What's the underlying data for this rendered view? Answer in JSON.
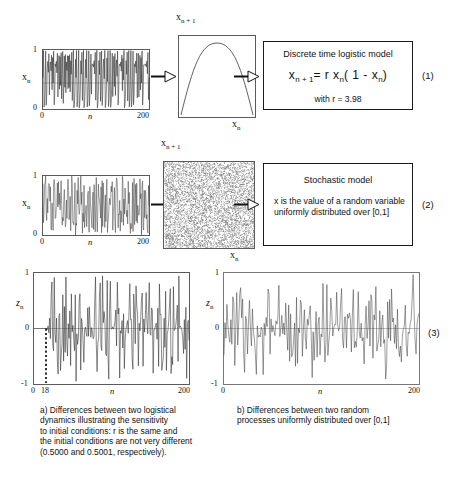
{
  "figure": {
    "rows": [
      {
        "id": "row-1",
        "eq_number": "(1)",
        "timeseries": {
          "ylabel": "x",
          "ylabel_sub": "n",
          "xlabel": "n",
          "yticks": [
            "1",
            "0"
          ],
          "xticks": [
            "0",
            "200"
          ]
        },
        "map_plot": {
          "ylabel": "x",
          "ylabel_sub": "n + 1",
          "xlabel": "x",
          "xlabel_sub": "n",
          "kind": "parabola"
        },
        "model": {
          "title": "Discrete time logistic model",
          "formula_lhs": "x",
          "formula_lhs_sub": "n + 1",
          "formula_rest": "=  r  x",
          "formula_mid_sub": "n",
          "formula_tail": "( 1 -  x",
          "formula_tail_sub": "n",
          "formula_close": ")",
          "note": "with r = 3.98"
        }
      },
      {
        "id": "row-2",
        "eq_number": "(2)",
        "timeseries": {
          "ylabel": "x",
          "ylabel_sub": "n",
          "xlabel": "n",
          "yticks": [
            "1",
            "0"
          ],
          "xticks": [
            "0",
            "200"
          ]
        },
        "map_plot": {
          "ylabel": "x",
          "ylabel_sub": "n + 1",
          "xlabel": "x",
          "xlabel_sub": "n",
          "kind": "uniform-scatter"
        },
        "model": {
          "title": "Stochastic model",
          "body": "x is the value of a random\nvariable uniformly distributed\n over [0,1]"
        }
      },
      {
        "id": "row-3",
        "eq_number": "(3)",
        "left_plot": {
          "ylabel": "z",
          "ylabel_sub": "n",
          "xlabel": "n",
          "yticks": [
            "1",
            "0",
            "-1"
          ],
          "xticks": [
            "0",
            "18",
            "200"
          ],
          "divergence_marker_n": 18
        },
        "right_plot": {
          "ylabel": "z",
          "ylabel_sub": "n",
          "xlabel": "n",
          "yticks": [
            "1",
            "0",
            "-1"
          ],
          "xticks": [
            "0",
            "200"
          ]
        },
        "caption_a": "a)   Differences between two logistical\ndynamics illustrating the sensitivity\nto initial conditions: r is the same and\nthe initial conditions are not very different\n(0.5000 and 0.5001, respectively).",
        "caption_b": "b) Differences between two random\nprocesses uniformly distributed over [0,1]"
      }
    ]
  },
  "chart_data": [
    {
      "type": "line",
      "id": "logistic-timeseries",
      "title": "",
      "xlabel": "n",
      "ylabel": "x_n",
      "xlim": [
        0,
        200
      ],
      "ylim": [
        0,
        1
      ],
      "xticks": [
        0,
        200
      ],
      "yticks": [
        0,
        1
      ],
      "grid": false,
      "description": "Chaotic logistic-map time series, r = 3.98, values densely filling [0,1]"
    },
    {
      "type": "line",
      "id": "logistic-map-parabola",
      "title": "",
      "xlabel": "x_n",
      "ylabel": "x_n+1",
      "xlim": [
        0,
        1
      ],
      "ylim": [
        0,
        1
      ],
      "grid": false,
      "description": "Parabola x_{n+1} = 3.98 x_n (1 - x_n), peak near (0.5, 0.995)"
    },
    {
      "type": "line",
      "id": "random-timeseries",
      "title": "",
      "xlabel": "n",
      "ylabel": "x_n",
      "xlim": [
        0,
        200
      ],
      "ylim": [
        0,
        1
      ],
      "xticks": [
        0,
        200
      ],
      "yticks": [
        0,
        1
      ],
      "grid": false,
      "description": "Uniform random time series on [0,1]"
    },
    {
      "type": "scatter",
      "id": "random-return-map",
      "title": "",
      "xlabel": "x_n",
      "ylabel": "x_n+1",
      "xlim": [
        0,
        1
      ],
      "ylim": [
        0,
        1
      ],
      "grid": false,
      "description": "Uniform random scatter cloud filling the unit square"
    },
    {
      "type": "line",
      "id": "logistic-difference",
      "title": "a) Differences between two logistical dynamics",
      "xlabel": "n",
      "ylabel": "z_n",
      "xlim": [
        0,
        200
      ],
      "ylim": [
        -1,
        1
      ],
      "xticks": [
        0,
        18,
        200
      ],
      "yticks": [
        -1,
        0,
        1
      ],
      "grid": false,
      "annotations": [
        "dashed vertical marker at n = 18"
      ],
      "description": "Difference between two logistic trajectories; zero until n=18 then chaotic spread over [-1,1]"
    },
    {
      "type": "line",
      "id": "random-difference",
      "title": "b) Differences between two random processes",
      "xlabel": "n",
      "ylabel": "z_n",
      "xlim": [
        0,
        200
      ],
      "ylim": [
        -1,
        1
      ],
      "xticks": [
        0,
        200
      ],
      "yticks": [
        -1,
        0,
        1
      ],
      "grid": false,
      "description": "Difference between two uniform random series, spread over [-1,1] from n=0"
    }
  ]
}
